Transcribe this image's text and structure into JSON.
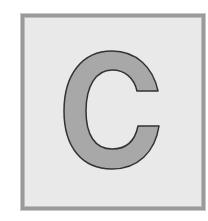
{
  "card": {
    "letter": "C",
    "background_color": "#e9e9e9",
    "border_color": "#9a9a9a",
    "letter_fill": "#a8a8a8",
    "letter_stroke": "#333333"
  }
}
